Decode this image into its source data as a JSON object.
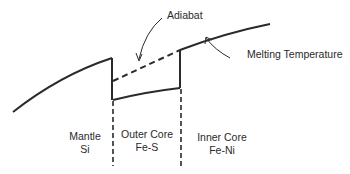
{
  "diagram": {
    "labels": {
      "adiabat": "Adiabat",
      "melting_temperature": "Melting Temperature"
    },
    "regions": [
      {
        "name": "Mantle",
        "composition": "Si"
      },
      {
        "name": "Outer Core",
        "composition": "Fe-S"
      },
      {
        "name": "Inner Core",
        "composition": "Fe-Ni"
      }
    ],
    "colors": {
      "line": "#2a2a2a",
      "background": "#ffffff"
    }
  }
}
